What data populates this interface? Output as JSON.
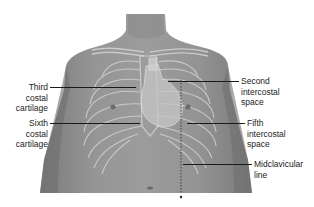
{
  "figure": {
    "colors": {
      "background": "#ffffff",
      "skin": "#8f8f8f",
      "skin_dark": "#6e6e6e",
      "bone_overlay": "#d8d8d8",
      "heart": "#c9c9c9",
      "leader_line": "#1a1a1a",
      "label_text": "#222222"
    }
  },
  "labels": {
    "third_costal_cartilage": {
      "line1": "Third",
      "line2": "costal",
      "line3": "cartilage"
    },
    "sixth_costal_cartilage": {
      "line1": "Sixth",
      "line2": "costal",
      "line3": "cartilage"
    },
    "second_intercostal_space": {
      "line1": "Second",
      "line2": "intercostal",
      "line3": "space"
    },
    "fifth_intercostal_space": {
      "line1": "Fifth",
      "line2": "intercostal",
      "line3": "space"
    },
    "midclavicular_line": {
      "line1": "Midclavicular",
      "line2": "line"
    }
  }
}
